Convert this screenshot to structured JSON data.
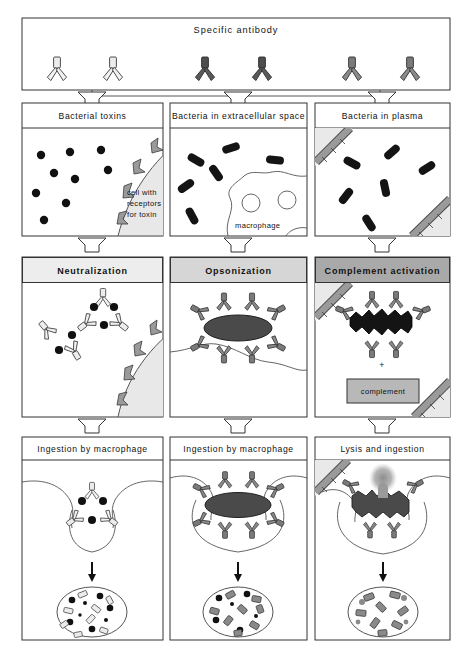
{
  "figure": {
    "panel_border_color": "#333333",
    "background": "#ffffff"
  },
  "top_panel": {
    "name": "specific-antibody-panel",
    "title": "Specific antibody",
    "antibody_groups": [
      {
        "shade": "light",
        "color": "#ececec",
        "count": 2,
        "label": "antibody-light"
      },
      {
        "shade": "dark",
        "color": "#4e4e4e",
        "count": 2,
        "label": "antibody-dark"
      },
      {
        "shade": "medium",
        "color": "#7a7a7a",
        "count": 2,
        "label": "antibody-medium"
      }
    ]
  },
  "columns": [
    {
      "id": "neutralization",
      "row2": {
        "title": "Bacterial toxins",
        "annotation": [
          "cell  with",
          "receptors",
          "for toxin"
        ],
        "toxin_dot_count": 9,
        "receptor_count": 4
      },
      "row3": {
        "title": "Neutralization",
        "header_bg": "#ededed",
        "complex_count": 2,
        "description": "antibody-toxin complexes"
      },
      "row4": {
        "title": "Ingestion by macrophage",
        "vesicle_label": "degraded fragments"
      }
    },
    {
      "id": "opsonization",
      "row2": {
        "title": "Bacteria in extracellular space",
        "annotation": [
          "macrophage"
        ],
        "bacteria_count": 6,
        "nuclei_count": 2
      },
      "row3": {
        "title": "Opsonization",
        "header_bg": "#d6d6d6",
        "bacterium_count": 1,
        "bound_antibody_count": 8
      },
      "row4": {
        "title": "Ingestion by macrophage",
        "vesicle_label": "degraded fragments"
      }
    },
    {
      "id": "complement-activation",
      "row2": {
        "title": "Bacteria in plasma",
        "annotation": [],
        "bacteria_count": 6,
        "vessel_walls": 2
      },
      "row3": {
        "title": "Complement activation",
        "header_bg": "#a9a9a9",
        "plus_sign": "+",
        "complement_box_label": "complement",
        "complement_box_bg": "#b8b8b8"
      },
      "row4": {
        "title": "Lysis and ingestion",
        "vesicle_label": "degraded fragments"
      }
    }
  ],
  "palette": {
    "antibody_light": "#ececec",
    "antibody_medium": "#7a7a7a",
    "antibody_dark": "#4e4e4e",
    "toxin_dot": "#111111",
    "bacterium": "#141414",
    "bacterium_gray": "#4f4f4f",
    "cell_fill": "#e8e8e8",
    "vessel_fill": "#e9e9e9",
    "endothelium": "#8f8f8f",
    "stroke": "#333333"
  }
}
